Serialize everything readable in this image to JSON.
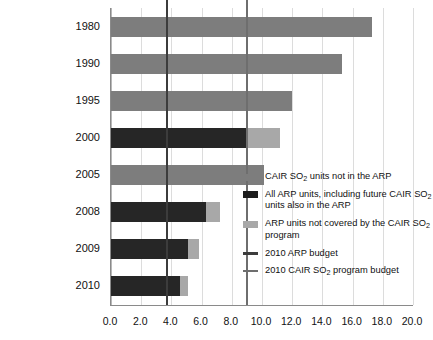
{
  "chart_data": {
    "type": "bar",
    "orientation": "horizontal",
    "stacked": true,
    "title": "",
    "xlabel": "",
    "ylabel": "",
    "xlim": [
      0.0,
      20.0
    ],
    "xticks": [
      "0.0",
      "2.0",
      "4.0",
      "6.0",
      "8.0",
      "10.0",
      "12.0",
      "14.0",
      "16.0",
      "18.0",
      "20.0"
    ],
    "xtick_values": [
      0,
      2,
      4,
      6,
      8,
      10,
      12,
      14,
      16,
      18,
      20
    ],
    "grid": true,
    "grid_axis": "x",
    "categories": [
      "1980",
      "1990",
      "1995",
      "2000",
      "2005",
      "2008",
      "2009",
      "2010"
    ],
    "series": [
      {
        "name": "CAIR SO2 units not in the ARP",
        "color": "#7d7d7d",
        "values": [
          17.3,
          15.3,
          12.0,
          0.0,
          10.1,
          0.0,
          0.0,
          0.0
        ]
      },
      {
        "name": "All ARP units, including future CAIR SO2 units also in the ARP",
        "color": "#262626",
        "values": [
          0.0,
          0.0,
          0.0,
          9.1,
          0.0,
          6.3,
          5.1,
          4.6
        ]
      },
      {
        "name": "ARP units not covered by the CAIR SO2 program",
        "color": "#a8a8a8",
        "values": [
          0.0,
          0.0,
          0.0,
          2.1,
          0.0,
          0.9,
          0.7,
          0.5
        ]
      }
    ],
    "totals": [
      17.3,
      15.3,
      12.0,
      11.2,
      10.1,
      7.2,
      5.8,
      5.1
    ],
    "reference_lines": [
      {
        "name": "2010 ARP budget",
        "value": 3.7,
        "color": "#3c3c3c"
      },
      {
        "name": "2010 CAIR SO2 program budget",
        "value": 9.0,
        "color": "#6e6e6e"
      }
    ]
  },
  "legend": {
    "position": "inside-right",
    "items": [
      {
        "swatch": "block",
        "color_key": "sw-cair",
        "text_before": "CAIR SO",
        "sub": "2",
        "text_after": " units not in the ARP"
      },
      {
        "swatch": "block",
        "color_key": "sw-arpall",
        "text_before": "All ARP units, including future CAIR SO",
        "sub": "2",
        "text_after": " units also in the ARP"
      },
      {
        "swatch": "block",
        "color_key": "sw-arpnot",
        "text_before": "ARP units not covered by the CAIR SO",
        "sub": "2",
        "text_after": " program"
      },
      {
        "swatch": "line",
        "color_key": "sw-l-arp",
        "text_before": "2010 ARP budget",
        "sub": "",
        "text_after": ""
      },
      {
        "swatch": "line",
        "color_key": "sw-l-cair",
        "text_before": "2010 CAIR SO",
        "sub": "2",
        "text_after": " program budget"
      }
    ]
  }
}
